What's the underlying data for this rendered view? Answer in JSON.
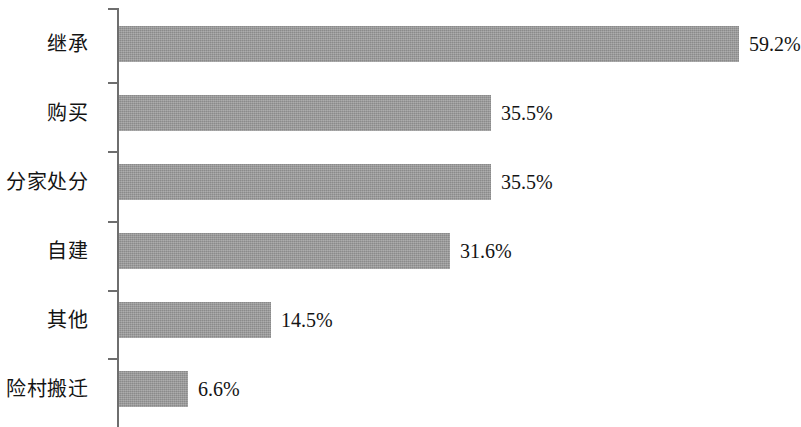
{
  "chart_data": {
    "type": "bar",
    "orientation": "horizontal",
    "title": "",
    "subtitle": "",
    "xlabel": "",
    "ylabel": "",
    "xlim": [
      0,
      78
    ],
    "grid": false,
    "legend": null,
    "bar_color": "#9b9b9b",
    "axis_color": "#6e6e6e",
    "text_color": "#141414",
    "value_suffix": "%",
    "categories": [
      "继承",
      "购买",
      "分家处分",
      "自建",
      "其他",
      "险村搬迁"
    ],
    "values": [
      59.2,
      35.5,
      35.5,
      31.6,
      14.5,
      6.6
    ],
    "value_labels": [
      "59.2%",
      "35.5%",
      "35.5%",
      "31.6%",
      "14.5%",
      "6.6%"
    ],
    "bars": [
      {
        "category": "继承",
        "value": 59.2,
        "label": "59.2%"
      },
      {
        "category": "购买",
        "value": 35.5,
        "label": "35.5%"
      },
      {
        "category": "分家处分",
        "value": 35.5,
        "label": "35.5%"
      },
      {
        "category": "自建",
        "value": 31.6,
        "label": "31.6%"
      },
      {
        "category": "其他",
        "value": 14.5,
        "label": "14.5%"
      },
      {
        "category": "险村搬迁",
        "value": 6.6,
        "label": "6.6%"
      }
    ]
  }
}
